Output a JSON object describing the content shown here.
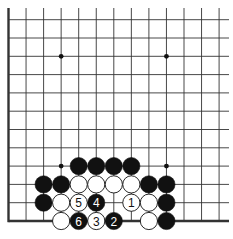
{
  "diagram": {
    "type": "go-board-fragment",
    "columns": 13,
    "rows": 12,
    "edges": {
      "left": true,
      "bottom": true,
      "top": false,
      "right": false
    },
    "hoshi": [
      {
        "col": 3,
        "row": 2
      },
      {
        "col": 9,
        "row": 2
      },
      {
        "col": 3,
        "row": 8
      },
      {
        "col": 9,
        "row": 8
      }
    ],
    "stones": [
      {
        "col": 4,
        "row": 8,
        "color": "black"
      },
      {
        "col": 5,
        "row": 8,
        "color": "black"
      },
      {
        "col": 6,
        "row": 8,
        "color": "black"
      },
      {
        "col": 7,
        "row": 8,
        "color": "black"
      },
      {
        "col": 2,
        "row": 9,
        "color": "black"
      },
      {
        "col": 3,
        "row": 9,
        "color": "black"
      },
      {
        "col": 4,
        "row": 9,
        "color": "white"
      },
      {
        "col": 5,
        "row": 9,
        "color": "white"
      },
      {
        "col": 6,
        "row": 9,
        "color": "white"
      },
      {
        "col": 7,
        "row": 9,
        "color": "white"
      },
      {
        "col": 8,
        "row": 9,
        "color": "black"
      },
      {
        "col": 9,
        "row": 9,
        "color": "black"
      },
      {
        "col": 2,
        "row": 10,
        "color": "black"
      },
      {
        "col": 3,
        "row": 10,
        "color": "white"
      },
      {
        "col": 4,
        "row": 10,
        "color": "white",
        "label": "5"
      },
      {
        "col": 5,
        "row": 10,
        "color": "black",
        "label": "4"
      },
      {
        "col": 7,
        "row": 10,
        "color": "white",
        "label": "1"
      },
      {
        "col": 8,
        "row": 10,
        "color": "white"
      },
      {
        "col": 9,
        "row": 10,
        "color": "black"
      },
      {
        "col": 3,
        "row": 11,
        "color": "white"
      },
      {
        "col": 4,
        "row": 11,
        "color": "black",
        "label": "6"
      },
      {
        "col": 5,
        "row": 11,
        "color": "white",
        "label": "3"
      },
      {
        "col": 6,
        "row": 11,
        "color": "black",
        "label": "2"
      },
      {
        "col": 8,
        "row": 11,
        "color": "white"
      },
      {
        "col": 9,
        "row": 11,
        "color": "black"
      }
    ],
    "colors": {
      "line": "#333333",
      "black_stone": "#111111",
      "white_stone": "#ffffff",
      "background": "#ffffff"
    }
  }
}
